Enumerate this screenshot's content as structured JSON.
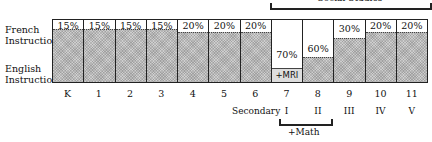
{
  "chart_data": {
    "type": "bar",
    "title": "",
    "row_labels": {
      "top": "French Instruction",
      "bottom": "English Instruction"
    },
    "categories": [
      "K",
      "1",
      "2",
      "3",
      "4",
      "5",
      "6",
      "7",
      "8",
      "9",
      "10",
      "11"
    ],
    "secondary_labels": {
      "prefix": "Secondary",
      "grades": [
        "I",
        "II",
        "III",
        "IV",
        "V"
      ]
    },
    "series": [
      {
        "name": "French Instruction",
        "values": [
          15,
          15,
          15,
          15,
          20,
          20,
          20,
          70,
          60,
          30,
          20,
          20
        ]
      }
    ],
    "value_labels": [
      "15%",
      "15%",
      "15%",
      "15%",
      "20%",
      "20%",
      "20%",
      "70%",
      "60%",
      "30%",
      "20%",
      "20%"
    ],
    "annotations": [
      "+MRI",
      "+Math",
      "Social Studies"
    ],
    "ylim": [
      0,
      100
    ]
  },
  "labels": {
    "french": "French Instruction",
    "english": "English Instruction",
    "secondary": "Secondary",
    "math": "+Math",
    "social": "Social Studies",
    "mri": "+MRI"
  }
}
